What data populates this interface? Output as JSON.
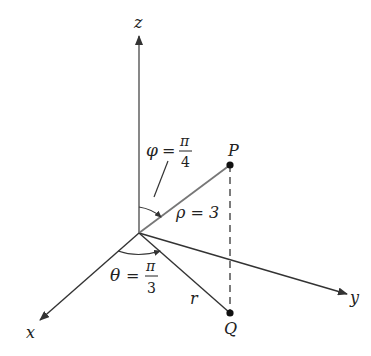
{
  "diagram": {
    "type": "spherical-coordinates-3d-axes",
    "axes": {
      "x": "x",
      "y": "y",
      "z": "z"
    },
    "points": {
      "P": {
        "label": "P"
      },
      "Q": {
        "label": "Q"
      }
    },
    "labels": {
      "phi_symbol": "φ",
      "phi_eq": "=",
      "phi_num": "π",
      "phi_den": "4",
      "theta_symbol": "θ",
      "theta_eq": "=",
      "theta_num": "π",
      "theta_den": "3",
      "rho": "ρ = 3",
      "r": "r"
    },
    "colors": {
      "axis": "#333333",
      "rho_segment": "#777777",
      "dashed": "#444444",
      "point": "#111111"
    }
  }
}
